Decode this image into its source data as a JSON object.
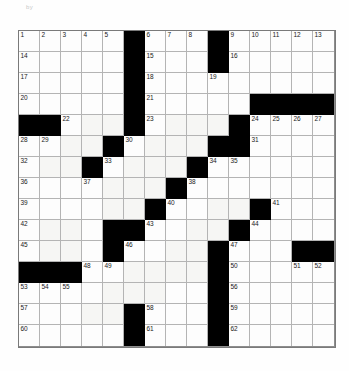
{
  "page": {
    "grid_size": 15,
    "background_color": "#ffffff",
    "block_color": "#000000",
    "cell_color": "#fdfdfd",
    "grid_line_color": "#b4b4b4"
  },
  "header": {
    "left_faint_text": "by",
    "mid_faint_text": "",
    "right_faint_text": ""
  },
  "grid": {
    "rows": 15,
    "cols": 15,
    "blocks": [
      [
        1,
        6
      ],
      [
        1,
        10
      ],
      [
        2,
        6
      ],
      [
        2,
        10
      ],
      [
        3,
        6
      ],
      [
        4,
        6
      ],
      [
        4,
        12
      ],
      [
        4,
        13
      ],
      [
        4,
        14
      ],
      [
        4,
        15
      ],
      [
        5,
        1
      ],
      [
        5,
        2
      ],
      [
        5,
        6
      ],
      [
        5,
        11
      ],
      [
        6,
        5
      ],
      [
        6,
        10
      ],
      [
        6,
        11
      ],
      [
        7,
        4
      ],
      [
        7,
        9
      ],
      [
        8,
        8
      ],
      [
        9,
        7
      ],
      [
        9,
        12
      ],
      [
        10,
        5
      ],
      [
        10,
        6
      ],
      [
        10,
        11
      ],
      [
        11,
        5
      ],
      [
        11,
        10
      ],
      [
        11,
        14
      ],
      [
        11,
        15
      ],
      [
        12,
        1
      ],
      [
        12,
        2
      ],
      [
        12,
        3
      ],
      [
        12,
        10
      ],
      [
        13,
        10
      ],
      [
        14,
        6
      ],
      [
        14,
        10
      ],
      [
        15,
        6
      ],
      [
        15,
        10
      ]
    ],
    "numbers": [
      {
        "n": 1,
        "row": 1,
        "col": 1
      },
      {
        "n": 2,
        "row": 1,
        "col": 2
      },
      {
        "n": 3,
        "row": 1,
        "col": 3
      },
      {
        "n": 4,
        "row": 1,
        "col": 4
      },
      {
        "n": 5,
        "row": 1,
        "col": 5
      },
      {
        "n": 6,
        "row": 1,
        "col": 7
      },
      {
        "n": 7,
        "row": 1,
        "col": 8
      },
      {
        "n": 8,
        "row": 1,
        "col": 9
      },
      {
        "n": 9,
        "row": 1,
        "col": 11
      },
      {
        "n": 10,
        "row": 1,
        "col": 12
      },
      {
        "n": 11,
        "row": 1,
        "col": 13
      },
      {
        "n": 12,
        "row": 1,
        "col": 14
      },
      {
        "n": 13,
        "row": 1,
        "col": 15
      },
      {
        "n": 14,
        "row": 2,
        "col": 1
      },
      {
        "n": 15,
        "row": 2,
        "col": 7
      },
      {
        "n": 16,
        "row": 2,
        "col": 11
      },
      {
        "n": 17,
        "row": 3,
        "col": 1
      },
      {
        "n": 18,
        "row": 3,
        "col": 7
      },
      {
        "n": 19,
        "row": 3,
        "col": 10
      },
      {
        "n": 20,
        "row": 4,
        "col": 1
      },
      {
        "n": 21,
        "row": 4,
        "col": 7
      },
      {
        "n": 22,
        "row": 5,
        "col": 3
      },
      {
        "n": 23,
        "row": 5,
        "col": 7
      },
      {
        "n": 24,
        "row": 5,
        "col": 12
      },
      {
        "n": 25,
        "row": 5,
        "col": 13
      },
      {
        "n": 26,
        "row": 5,
        "col": 14
      },
      {
        "n": 27,
        "row": 5,
        "col": 15
      },
      {
        "n": 28,
        "row": 6,
        "col": 1
      },
      {
        "n": 29,
        "row": 6,
        "col": 2
      },
      {
        "n": 30,
        "row": 6,
        "col": 6
      },
      {
        "n": 31,
        "row": 6,
        "col": 12
      },
      {
        "n": 32,
        "row": 7,
        "col": 1
      },
      {
        "n": 33,
        "row": 7,
        "col": 5
      },
      {
        "n": 34,
        "row": 7,
        "col": 10
      },
      {
        "n": 35,
        "row": 7,
        "col": 11
      },
      {
        "n": 36,
        "row": 8,
        "col": 1
      },
      {
        "n": 37,
        "row": 8,
        "col": 4
      },
      {
        "n": 38,
        "row": 8,
        "col": 9
      },
      {
        "n": 39,
        "row": 9,
        "col": 1
      },
      {
        "n": 40,
        "row": 9,
        "col": 8
      },
      {
        "n": 41,
        "row": 9,
        "col": 13
      },
      {
        "n": 42,
        "row": 10,
        "col": 1
      },
      {
        "n": 43,
        "row": 10,
        "col": 7
      },
      {
        "n": 44,
        "row": 10,
        "col": 12
      },
      {
        "n": 45,
        "row": 11,
        "col": 1
      },
      {
        "n": 46,
        "row": 11,
        "col": 6
      },
      {
        "n": 47,
        "row": 11,
        "col": 11
      },
      {
        "n": 48,
        "row": 12,
        "col": 4
      },
      {
        "n": 49,
        "row": 12,
        "col": 5
      },
      {
        "n": 50,
        "row": 12,
        "col": 11
      },
      {
        "n": 51,
        "row": 12,
        "col": 14
      },
      {
        "n": 52,
        "row": 12,
        "col": 15
      },
      {
        "n": 53,
        "row": 13,
        "col": 1
      },
      {
        "n": 54,
        "row": 13,
        "col": 2
      },
      {
        "n": 55,
        "row": 13,
        "col": 3
      },
      {
        "n": 56,
        "row": 13,
        "col": 11
      },
      {
        "n": 57,
        "row": 14,
        "col": 1
      },
      {
        "n": 58,
        "row": 14,
        "col": 7
      },
      {
        "n": 59,
        "row": 14,
        "col": 11
      },
      {
        "n": 60,
        "row": 15,
        "col": 1
      },
      {
        "n": 61,
        "row": 15,
        "col": 7
      },
      {
        "n": 62,
        "row": 15,
        "col": 11
      }
    ],
    "tinted_cells": [
      [
        5,
        4
      ],
      [
        5,
        5
      ],
      [
        5,
        8
      ],
      [
        5,
        9
      ],
      [
        5,
        10
      ],
      [
        6,
        3
      ],
      [
        6,
        4
      ],
      [
        6,
        7
      ],
      [
        6,
        8
      ],
      [
        6,
        9
      ],
      [
        7,
        2
      ],
      [
        7,
        3
      ],
      [
        7,
        6
      ],
      [
        7,
        7
      ],
      [
        7,
        8
      ],
      [
        8,
        5
      ],
      [
        8,
        6
      ],
      [
        8,
        7
      ],
      [
        9,
        5
      ],
      [
        9,
        6
      ],
      [
        9,
        10
      ],
      [
        9,
        11
      ],
      [
        10,
        2
      ],
      [
        10,
        3
      ],
      [
        10,
        9
      ],
      [
        10,
        10
      ],
      [
        11,
        2
      ],
      [
        11,
        3
      ],
      [
        11,
        8
      ],
      [
        11,
        9
      ],
      [
        12,
        6
      ],
      [
        12,
        7
      ],
      [
        12,
        8
      ],
      [
        12,
        9
      ],
      [
        13,
        5
      ],
      [
        13,
        6
      ],
      [
        13,
        7
      ],
      [
        14,
        4
      ],
      [
        14,
        5
      ]
    ]
  }
}
